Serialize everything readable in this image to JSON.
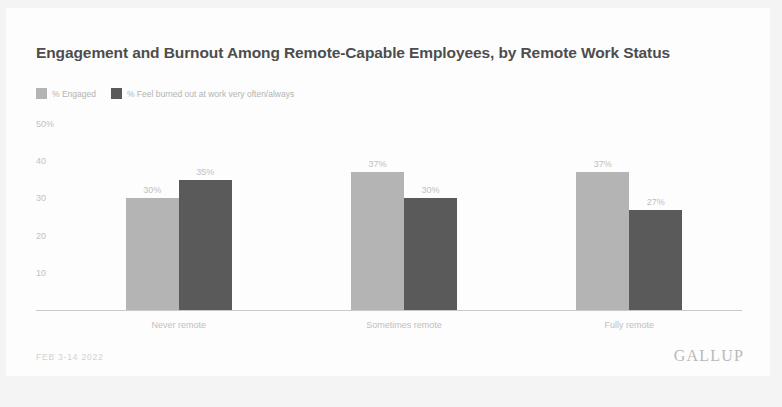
{
  "card": {
    "background": "#fdfdfd",
    "page_background": "#f4f4f4"
  },
  "footer": {
    "date": "FEB 3-14 2022",
    "brand": "GALLUP"
  },
  "chart_data": {
    "type": "bar",
    "title": "Engagement and Burnout Among Remote-Capable Employees, by Remote Work Status",
    "xlabel": "",
    "ylabel": "",
    "ylim": [
      0,
      50
    ],
    "grid": false,
    "legend_position": "top-left",
    "categories": [
      "Never remote",
      "Sometimes remote",
      "Fully remote"
    ],
    "ticks": [
      {
        "value": 50,
        "label": "50%"
      },
      {
        "value": 40,
        "label": "40"
      },
      {
        "value": 30,
        "label": "30"
      },
      {
        "value": 20,
        "label": "20"
      },
      {
        "value": 10,
        "label": "10"
      }
    ],
    "series": [
      {
        "name": "% Engaged",
        "color": "#b4b4b4",
        "values": [
          30,
          37,
          37
        ],
        "labels": [
          "30%",
          "37%",
          "37%"
        ]
      },
      {
        "name": "% Feel burned out at work very often/always",
        "color": "#5a5a5a",
        "values": [
          35,
          30,
          27
        ],
        "labels": [
          "35%",
          "30%",
          "27%"
        ]
      }
    ]
  }
}
